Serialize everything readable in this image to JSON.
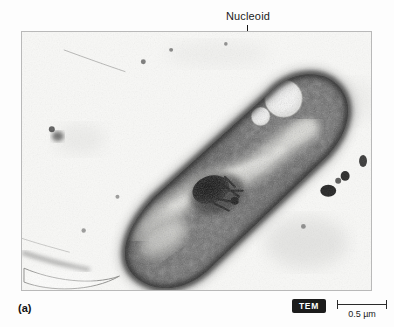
{
  "figure": {
    "panel_letter": "(a)",
    "callout": {
      "label": "Nucleoid",
      "leader_line": "vertical-leader-line"
    },
    "micrograph": {
      "technique_badge": "TEM",
      "subject": "prokaryotic-bacterial-cell-thin-section",
      "alt": "Transmission electron micrograph of a rod-shaped bacterial cell showing a light-staining nucleoid region, two electron-lucent vesicles, a dark electron-dense granule, and surrounding granular cytoplasm."
    },
    "scale_bar": {
      "value": "0.5",
      "unit": "µm",
      "label": "0.5 µm",
      "length_px": 50
    },
    "colors": {
      "background": "#fdfdfd",
      "frame_border": "#b9b9b9",
      "leader_line": "#151515",
      "badge_background": "#1c1c1c",
      "badge_text": "#ffffff",
      "scale_bar": "#2a2a2a",
      "text": "#1b1b1b"
    }
  }
}
